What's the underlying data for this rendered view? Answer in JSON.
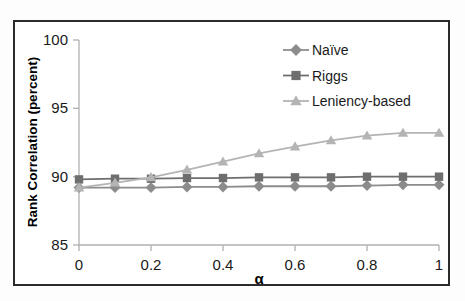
{
  "chart_data": {
    "type": "line",
    "title": "",
    "xlabel": "α",
    "ylabel": "Rank Correlation (percent)",
    "xlim": [
      0,
      1
    ],
    "ylim": [
      85,
      100
    ],
    "grid": false,
    "legend_position": "top-right",
    "x": [
      0,
      0.1,
      0.2,
      0.3,
      0.4,
      0.5,
      0.6,
      0.7,
      0.8,
      0.9,
      1
    ],
    "xticks": [
      "0",
      "0.2",
      "0.4",
      "0.6",
      "0.8",
      "1"
    ],
    "xtick_values": [
      0,
      0.2,
      0.4,
      0.6,
      0.8,
      1
    ],
    "yticks": [
      "85",
      "90",
      "95",
      "100"
    ],
    "ytick_values": [
      85,
      90,
      95,
      100
    ],
    "series": [
      {
        "name": "Naïve",
        "marker": "diamond",
        "color": "#8c8c8c",
        "values": [
          89.2,
          89.2,
          89.2,
          89.25,
          89.25,
          89.3,
          89.3,
          89.3,
          89.35,
          89.4,
          89.4
        ]
      },
      {
        "name": "Riggs",
        "marker": "square",
        "color": "#6e6e6e",
        "values": [
          89.8,
          89.85,
          89.85,
          89.9,
          89.9,
          89.95,
          89.95,
          89.95,
          90.0,
          90.0,
          90.0
        ]
      },
      {
        "name": "Leniency-based",
        "marker": "triangle",
        "color": "#b4b4b4",
        "values": [
          89.2,
          89.55,
          89.95,
          90.5,
          91.1,
          91.7,
          92.2,
          92.65,
          93.0,
          93.2,
          93.2
        ]
      }
    ]
  },
  "legend": {
    "items": [
      {
        "label": "Naïve"
      },
      {
        "label": "Riggs"
      },
      {
        "label": "Leniency-based"
      }
    ]
  },
  "axes": {
    "y_title": "Rank Correlation (percent)",
    "x_title": "α"
  },
  "colors": {
    "naive": "#8c8c8c",
    "riggs": "#6e6e6e",
    "leniency": "#b4b4b4",
    "axis": "#b0b0b0",
    "frame": "#2b2b2b",
    "text": "#1a1a1a",
    "background": "#ffffff"
  }
}
